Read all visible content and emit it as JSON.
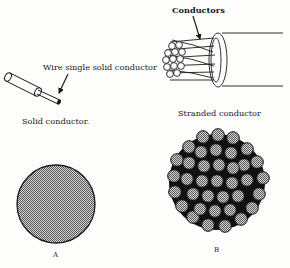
{
  "figure": {
    "solid": {
      "pointer_label": "Wire single solid conductor",
      "caption": "Solid conductor."
    },
    "stranded": {
      "pointer_label": "Conductors",
      "caption": "Stranded conductor"
    },
    "cross_sections": {
      "a_label": "A",
      "b_label": "B"
    }
  },
  "colors": {
    "ink": "#1a1a1a",
    "background": "#fdfdfb",
    "stipple": "#9a9a9a"
  }
}
